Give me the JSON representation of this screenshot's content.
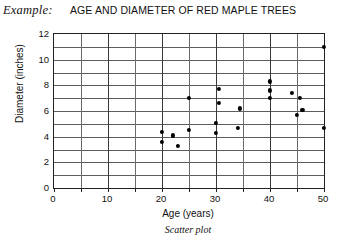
{
  "header": {
    "example_label": "Example:",
    "title": "AGE AND DIAMETER OF RED MAPLE TREES"
  },
  "caption": "Scatter plot",
  "chart_data": {
    "type": "scatter",
    "title": "AGE AND DIAMETER OF RED MAPLE TREES",
    "xlabel": "Age (years)",
    "ylabel": "Diameter (inches)",
    "xlim": [
      0,
      50
    ],
    "ylim": [
      0,
      12
    ],
    "xticks": [
      0,
      5,
      10,
      15,
      20,
      25,
      30,
      35,
      40,
      45,
      50
    ],
    "xtick_labels": [
      "0",
      "",
      "10",
      "",
      "20",
      "",
      "30",
      "",
      "40",
      "",
      "50"
    ],
    "yticks": [
      0,
      1,
      2,
      3,
      4,
      5,
      6,
      7,
      8,
      9,
      10,
      11,
      12
    ],
    "ytick_labels": [
      "0",
      "",
      "2",
      "",
      "4",
      "",
      "6",
      "",
      "8",
      "",
      "10",
      "",
      "12"
    ],
    "grid": true,
    "legend": false,
    "points": [
      {
        "x": 20.0,
        "y": 4.4
      },
      {
        "x": 20.0,
        "y": 3.6
      },
      {
        "x": 22.0,
        "y": 4.1
      },
      {
        "x": 23.0,
        "y": 3.3
      },
      {
        "x": 25.0,
        "y": 4.5
      },
      {
        "x": 25.0,
        "y": 7.0
      },
      {
        "x": 30.0,
        "y": 5.1
      },
      {
        "x": 30.0,
        "y": 4.3
      },
      {
        "x": 30.5,
        "y": 7.7
      },
      {
        "x": 30.5,
        "y": 6.6
      },
      {
        "x": 34.0,
        "y": 4.7
      },
      {
        "x": 34.5,
        "y": 6.2
      },
      {
        "x": 40.0,
        "y": 8.3
      },
      {
        "x": 40.0,
        "y": 7.6
      },
      {
        "x": 40.0,
        "y": 7.0
      },
      {
        "x": 44.0,
        "y": 7.4
      },
      {
        "x": 45.5,
        "y": 7.0
      },
      {
        "x": 45.0,
        "y": 5.7
      },
      {
        "x": 46.0,
        "y": 6.1
      },
      {
        "x": 50.0,
        "y": 11.0
      },
      {
        "x": 50.0,
        "y": 4.7
      }
    ]
  }
}
